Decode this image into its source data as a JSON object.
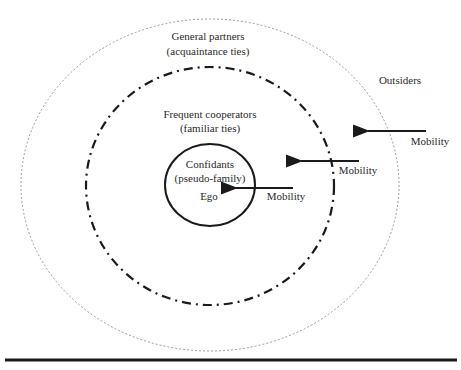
{
  "diagram": {
    "rings": [
      {
        "name": "general-partners",
        "title": "General partners",
        "subtitle": "(acquaintance ties)",
        "style": "dotted"
      },
      {
        "name": "frequent-cooperators",
        "title": "Frequent cooperators",
        "subtitle": "(familiar ties)",
        "style": "dash-dot"
      },
      {
        "name": "confidants",
        "title": "Confidants",
        "subtitle": "(pseudo-family)",
        "style": "solid"
      }
    ],
    "center_label": "Ego",
    "outside_label": "Outsiders",
    "arrows": [
      {
        "label": "Mobility"
      },
      {
        "label": "Mobility"
      },
      {
        "label": "Mobility"
      }
    ],
    "colors": {
      "line": "#1a1a1a",
      "dotted": "#9a9a9a",
      "text": "#2a2a2a"
    }
  }
}
